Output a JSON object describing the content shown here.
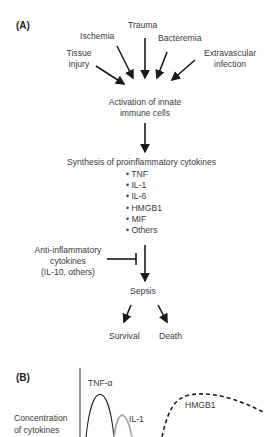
{
  "panel_a": {
    "label": "(A)",
    "causes": {
      "trauma": "Trauma",
      "ischemia": "Ischemia",
      "bacteremia": "Bacteremia",
      "tissue_injury": [
        "Tissue",
        "injury"
      ],
      "extravascular_infection": [
        "Extravascular",
        "infection"
      ]
    },
    "activation": [
      "Activation of innate",
      "immune cells"
    ],
    "synthesis": "Synthesis of proinflammatory cytokines",
    "cytokines": [
      "• TNF",
      "• IL-1",
      "• IL-6",
      "• HMGB1",
      "• MIF",
      "• Others"
    ],
    "anti_inflammatory": [
      "Anti-inflammatory",
      "cytokines",
      "(IL-10, others)"
    ],
    "sepsis": "Sepsis",
    "outcomes": {
      "survival": "Survival",
      "death": "Death"
    }
  },
  "panel_b": {
    "label": "(B)",
    "ylabel": [
      "Concentration",
      "of cytokines"
    ],
    "curves": {
      "tnf": "TNF-α",
      "il1": "IL-1",
      "hmgb1": "HMGB1"
    }
  }
}
